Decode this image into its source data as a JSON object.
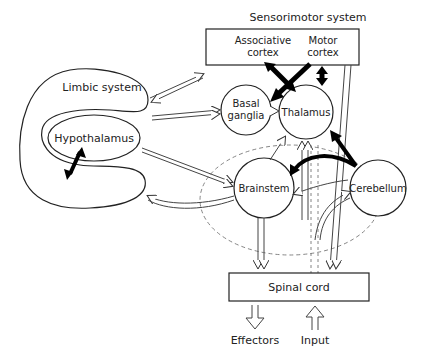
{
  "diagram": {
    "title": "Sensorimotor system",
    "nodes": {
      "associative_cortex": {
        "line1": "Associative",
        "line2": "cortex"
      },
      "motor_cortex": {
        "line1": "Motor",
        "line2": "cortex"
      },
      "limbic_system": "Limbic system",
      "hypothalamus": "Hypothalamus",
      "basal_ganglia": {
        "line1": "Basal",
        "line2": "ganglia"
      },
      "thalamus": "Thalamus",
      "brainstem": "Brainstem",
      "cerebellum": "Cerebellum",
      "spinal_cord": "Spinal cord"
    },
    "outputs": {
      "effectors": "Effectors",
      "input": "Input"
    },
    "colors": {
      "line": "#222222",
      "filled_arrow": "#000000",
      "dashed": "#666666"
    }
  }
}
